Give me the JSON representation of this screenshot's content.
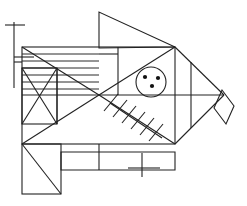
{
  "figure": {
    "canvas": {
      "width": 247,
      "height": 206,
      "background": "#ffffff"
    },
    "stroke_color": "#222222",
    "stroke_width": 1.1,
    "parts": [
      {
        "name": "left-vertical-axis-line",
        "type": "line",
        "points": "[[14,22],[14,88]]"
      },
      {
        "name": "upper-tick-mark",
        "type": "line",
        "points": "[[5,25],[25,25]]"
      },
      {
        "name": "lower-tick-mark",
        "type": "line",
        "points": "[[14,57],[34,57]]"
      },
      {
        "name": "bottom-tick-mark",
        "type": "line",
        "points": "[[142,153],[142,177]]"
      },
      {
        "name": "bottom-tick-crossbar",
        "type": "line",
        "points": "[[128,168],[160,168]]"
      },
      {
        "name": "dorsal-fin-triangle",
        "type": "polygon",
        "points": "[[99,12],[99,48],[175,47]]"
      },
      {
        "name": "body-outer-rectangle",
        "type": "rect",
        "x": 22,
        "y": 47,
        "width": 153,
        "height": 97
      },
      {
        "name": "head-stripes-group",
        "type": "stripes",
        "count": 6,
        "x1": 22,
        "x2": 99,
        "y_values": [
          54,
          61,
          68,
          75,
          82,
          89
        ]
      },
      {
        "name": "upper-left-diagonal",
        "type": "line",
        "points": "[[22,47],[99,95]]"
      },
      {
        "name": "center-cross-diagonal-down",
        "type": "line",
        "points": "[[99,95],[175,47]]"
      },
      {
        "name": "center-cross-diagonal-up",
        "type": "line",
        "points": "[[99,95],[175,144]]"
      },
      {
        "name": "lower-left-diagonal",
        "type": "line",
        "points": "[[22,144],[99,95]]"
      },
      {
        "name": "horizontal-midline",
        "type": "line",
        "points": "[[22,95],[224,95]]"
      },
      {
        "name": "x-box-rectangle",
        "type": "rect",
        "x": 22,
        "y": 68,
        "width": 35,
        "height": 56
      },
      {
        "name": "x-box-diagonal-a",
        "type": "line",
        "points": "[[22,68],[57,124]]"
      },
      {
        "name": "x-box-diagonal-b",
        "type": "line",
        "points": "[[57,68],[22,124]]"
      },
      {
        "name": "x-box-vertical-divider",
        "type": "line",
        "points": "[[57,68],[57,124]]"
      },
      {
        "name": "gill-vertical-line",
        "type": "line",
        "points": "[[118,47],[118,95]]"
      },
      {
        "name": "gill-short-horizontal",
        "type": "line",
        "points": "[[99,54],[118,54]]"
      },
      {
        "name": "eye-circle",
        "type": "circle",
        "cx": 151,
        "cy": 82,
        "r": 15
      },
      {
        "name": "eye-dot-left",
        "type": "dot",
        "cx": 145,
        "cy": 77,
        "r": 2
      },
      {
        "name": "eye-dot-right",
        "type": "dot",
        "cx": 158,
        "cy": 78,
        "r": 2
      },
      {
        "name": "eye-dot-bottom",
        "type": "dot",
        "cx": 152,
        "cy": 86,
        "r": 2
      },
      {
        "name": "pectoral-fin-hatched-spine",
        "type": "line",
        "points": "[[110,103],[162,138]]"
      },
      {
        "name": "pectoral-fin-hatch-marks",
        "type": "hatch",
        "count": 6
      },
      {
        "name": "tail-upper-diagonal",
        "type": "line",
        "points": "[[175,47],[224,95]]"
      },
      {
        "name": "tail-lower-diagonal",
        "type": "line",
        "points": "[[175,144],[224,95]]"
      },
      {
        "name": "tail-inner-vertical",
        "type": "line",
        "points": "[[191,62],[191,128]]"
      },
      {
        "name": "tail-fin-diamond",
        "type": "polygon",
        "points": "[[222,90],[234,106],[226,124],[214,108]]"
      },
      {
        "name": "lower-body-rectangle",
        "type": "rect",
        "x": 22,
        "y": 144,
        "width": 39,
        "height": 50
      },
      {
        "name": "lower-body-diagonal",
        "type": "line",
        "points": "[[22,144],[61,194]]"
      },
      {
        "name": "belly-extension-rectangle",
        "type": "polygon",
        "points": "[[61,152],[175,152],[175,170],[61,170]]"
      },
      {
        "name": "belly-vertical-divider",
        "type": "line",
        "points": "[[99,144],[99,170]]"
      },
      {
        "name": "upper-left-edge-notch",
        "type": "line",
        "points": "[[14,62],[22,62]]"
      }
    ]
  }
}
